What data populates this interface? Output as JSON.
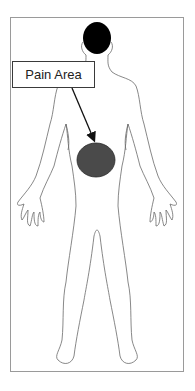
{
  "diagram": {
    "label": {
      "text": "Pain Area"
    },
    "pain_marker": {
      "shape": "ellipse",
      "region": "abdomen",
      "color": "#4a4a4a"
    },
    "colors": {
      "outline": "#6a6a6a",
      "head": "#000000",
      "frame": "#9a9a9a",
      "arrow": "#111111"
    }
  }
}
